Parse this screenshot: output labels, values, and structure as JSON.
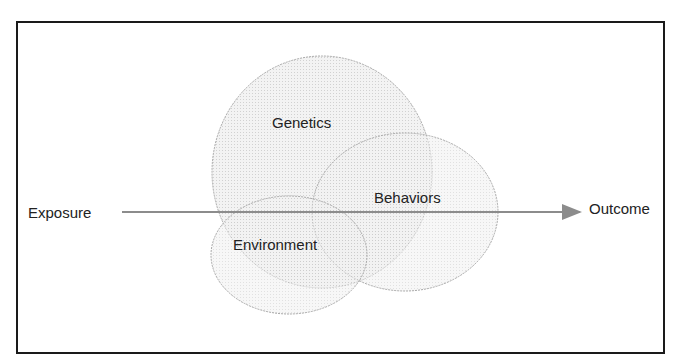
{
  "diagram": {
    "exposure_label": "Exposure",
    "outcome_label": "Outcome",
    "circles": [
      {
        "label": "Genetics",
        "cx": 322,
        "cy": 172,
        "rx": 110,
        "ry": 116
      },
      {
        "label": "Behaviors",
        "cx": 405,
        "cy": 212,
        "rx": 93,
        "ry": 79
      },
      {
        "label": "Environment",
        "cx": 289,
        "cy": 255,
        "rx": 78,
        "ry": 59
      }
    ],
    "arrow": {
      "x1": 122,
      "y1": 212,
      "x2": 580,
      "y2": 212
    },
    "colors": {
      "border": "#1a1a1a",
      "circle_fill": "#e6e6e6",
      "circle_stroke": "#a8a8a8",
      "arrow": "#8c8c8c",
      "text": "#222222"
    }
  }
}
